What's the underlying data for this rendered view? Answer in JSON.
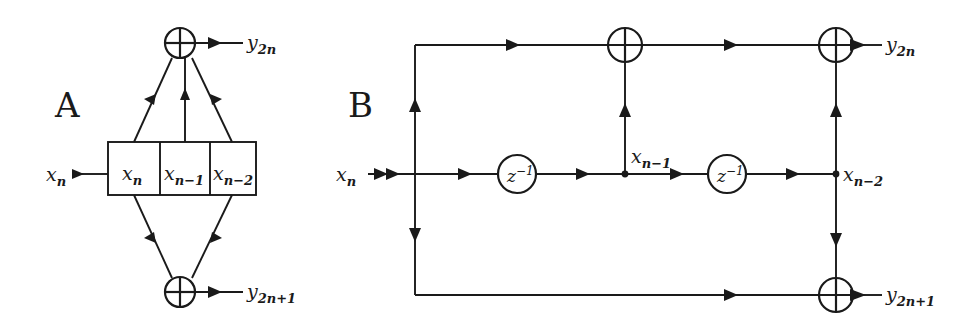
{
  "figure": {
    "width": 978,
    "height": 327,
    "background": "#ffffff",
    "ink_color": "#1a1a1a",
    "type": "signal-flow-diagram"
  },
  "panels": [
    {
      "id": "A",
      "label": "A",
      "label_x": 55,
      "label_y": 117,
      "style": "shift-register (tapped delay line) block form",
      "input": {
        "name": "x_n",
        "base": "x",
        "sub": "n",
        "label_x": 46,
        "label_y": 181
      },
      "register": {
        "name": "shift-register",
        "x": 108,
        "y": 142,
        "width": 148,
        "height": 53,
        "cells": [
          {
            "name": "cell-xn",
            "base": "x",
            "sub": "n",
            "width": 52
          },
          {
            "name": "cell-xn-1",
            "base": "x",
            "sub": "n−1",
            "width": 50
          },
          {
            "name": "cell-xn-2",
            "base": "x",
            "sub": "n−2",
            "width": 46
          }
        ]
      },
      "adders": [
        {
          "name": "adder-top",
          "cx": 180,
          "cy": 43,
          "r": 15,
          "symbol": "plus-in-circle"
        },
        {
          "name": "adder-bottom",
          "cx": 180,
          "cy": 292,
          "r": 15,
          "symbol": "plus-in-circle"
        }
      ],
      "outputs": [
        {
          "name": "y_2n",
          "base": "y",
          "sub": "2n",
          "label_x": 247,
          "label_y": 49
        },
        {
          "name": "y_2n+1",
          "base": "y",
          "sub": "2n+1",
          "label_x": 247,
          "label_y": 298
        }
      ]
    },
    {
      "id": "B",
      "label": "B",
      "label_x": 348,
      "label_y": 117,
      "style": "unit-delay (z^-1) flow-graph form",
      "input": {
        "name": "x_n",
        "base": "x",
        "sub": "n",
        "label_x": 336,
        "label_y": 181
      },
      "delays": [
        {
          "name": "delay-1",
          "cx": 517,
          "cy": 174,
          "r": 19,
          "base": "z",
          "sup": "−1"
        },
        {
          "name": "delay-2",
          "cx": 727,
          "cy": 174,
          "r": 19,
          "base": "z",
          "sup": "−1"
        }
      ],
      "nodes": [
        {
          "name": "node-xn",
          "cx": 415,
          "cy": 174,
          "labeled": false
        },
        {
          "name": "node-xn-1",
          "cx": 625,
          "cy": 174,
          "base": "x",
          "sub": "n−1",
          "label_x": 631,
          "label_y": 163
        },
        {
          "name": "node-xn-2",
          "cx": 836,
          "cy": 174,
          "base": "x",
          "sub": "n−2",
          "label_x": 843,
          "label_y": 181
        }
      ],
      "adders": [
        {
          "name": "adder-top-mid",
          "cx": 625,
          "cy": 45,
          "r": 17,
          "symbol": "plus-in-circle"
        },
        {
          "name": "adder-top-right",
          "cx": 836,
          "cy": 45,
          "r": 17,
          "symbol": "plus-in-circle"
        },
        {
          "name": "adder-bottom-right",
          "cx": 836,
          "cy": 295,
          "r": 17,
          "symbol": "plus-in-circle"
        }
      ],
      "outputs": [
        {
          "name": "y_2n",
          "base": "y",
          "sub": "2n",
          "label_x": 886,
          "label_y": 51
        },
        {
          "name": "y_2n+1",
          "base": "y",
          "sub": "2n+1",
          "label_x": 886,
          "label_y": 301
        }
      ]
    }
  ]
}
